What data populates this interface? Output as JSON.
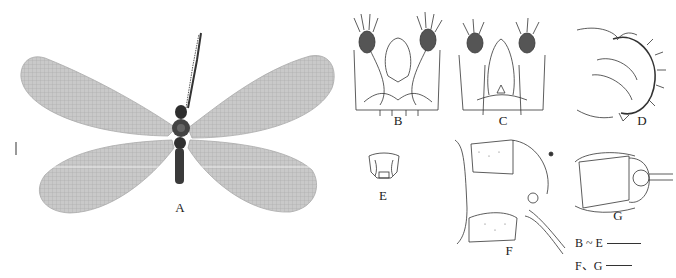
{
  "figure": {
    "panels": [
      {
        "id": "A",
        "label": "A",
        "description": "Adult habitus, dorsal view, wings spread"
      },
      {
        "id": "B",
        "label": "B",
        "description": "Male genitalia, dorsal view"
      },
      {
        "id": "C",
        "label": "C",
        "description": "Male genitalia, ventral view"
      },
      {
        "id": "D",
        "label": "D",
        "description": "Male genitalia, lateral view"
      },
      {
        "id": "E",
        "label": "E",
        "description": "Small structure, frontal view"
      },
      {
        "id": "F",
        "label": "F",
        "description": "Female terminalia, lateral view"
      },
      {
        "id": "G",
        "label": "G",
        "description": "Female terminalia, ventral view"
      }
    ],
    "scale_bars": [
      {
        "label": "B ~ E",
        "length_px": 34
      },
      {
        "label": "F、G",
        "length_px": 26
      }
    ],
    "colors": {
      "ink": "#222222",
      "wing": "#b8b8b8",
      "body": "#3a3a3a"
    }
  }
}
